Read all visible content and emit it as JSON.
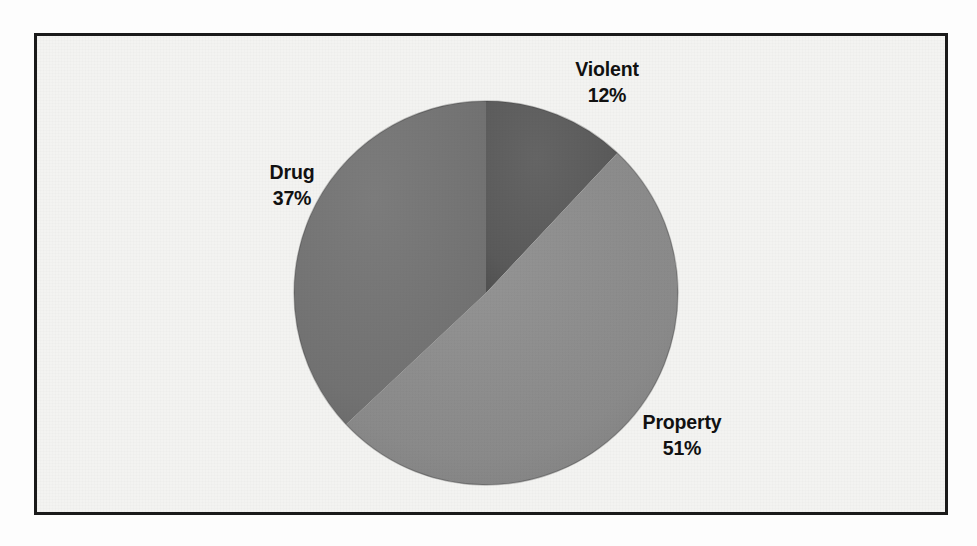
{
  "figure": {
    "frame_border_color": "#1a1a1a",
    "background_color": "#f3f3f1"
  },
  "chart_data": {
    "type": "pie",
    "title": "",
    "subtitle": "",
    "xlabel": "",
    "ylabel": "",
    "legend_position": "none",
    "grid": false,
    "start_angle_deg": 0,
    "direction": "clockwise",
    "categories": [
      "Violent",
      "Property",
      "Drug"
    ],
    "values": [
      12,
      51,
      37
    ],
    "units": "percent",
    "labels": [
      "Violent 12%",
      "Property 51%",
      "Drug 37%"
    ],
    "colors": [
      "#5c5c5c",
      "#8c8c8c",
      "#737373"
    ],
    "slices": [
      {
        "name": "Violent",
        "value": 12,
        "value_text": "12%",
        "color": "#5c5c5c",
        "start_deg": 0,
        "end_deg": 43.2
      },
      {
        "name": "Property",
        "value": 51,
        "value_text": "51%",
        "color": "#8c8c8c",
        "start_deg": 43.2,
        "end_deg": 226.8
      },
      {
        "name": "Drug",
        "value": 37,
        "value_text": "37%",
        "color": "#737373",
        "start_deg": 226.8,
        "end_deg": 360
      }
    ]
  },
  "labels": {
    "violent": {
      "name": "Violent",
      "value": "12%"
    },
    "property": {
      "name": "Property",
      "value": "51%"
    },
    "drug": {
      "name": "Drug",
      "value": "37%"
    }
  }
}
